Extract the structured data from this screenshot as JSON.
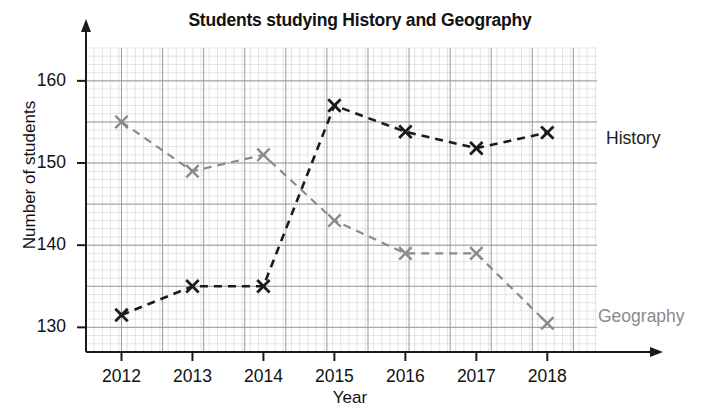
{
  "page": {
    "partial_top_text": "",
    "background": "#ffffff"
  },
  "chart_data": {
    "type": "line",
    "title": "Students studying History and Geography",
    "xlabel": "Year",
    "ylabel": "Number of students",
    "categories": [
      "2012",
      "2013",
      "2014",
      "2015",
      "2016",
      "2017",
      "2018"
    ],
    "x": [
      2012,
      2013,
      2014,
      2015,
      2016,
      2017,
      2018
    ],
    "series": [
      {
        "name": "History",
        "color": "#1b1b1b",
        "marker": "x",
        "linestyle": "dashed",
        "values": [
          131.5,
          135,
          135,
          157,
          153.8,
          151.8,
          153.7
        ]
      },
      {
        "name": "Geography",
        "color": "#8a8a8a",
        "marker": "x",
        "linestyle": "dashed",
        "values": [
          155,
          149,
          151,
          143,
          139,
          139,
          130.5
        ]
      }
    ],
    "ylim": [
      127,
      164
    ],
    "xlim": [
      2011.5,
      2018.7
    ],
    "yticks": [
      130,
      140,
      150,
      160
    ],
    "ytick_labels": [
      "130",
      "140",
      "150",
      "160"
    ],
    "minor_grid_step": 1,
    "major_grid_step": 5,
    "grid": true,
    "grid_color_minor": "#d8d8dc",
    "grid_color_major": "#9a9a9f",
    "axis_color": "#1b1b1b",
    "legend": "inline-right",
    "series_label_positions": [
      {
        "name": "History",
        "x": 606,
        "y": 128
      },
      {
        "name": "Geography",
        "x": 598,
        "y": 306
      }
    ]
  }
}
